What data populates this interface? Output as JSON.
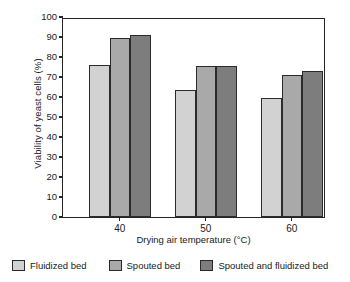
{
  "chart_data": {
    "type": "bar",
    "title": "",
    "xlabel": "Drying air temperature (°C)",
    "ylabel": "Viability of yeast cells (%)",
    "categories": [
      "40",
      "50",
      "60"
    ],
    "series": [
      {
        "name": "Fluidized bed",
        "values": [
          76.0,
          63.5,
          59.5
        ],
        "color": "#d2d2d2"
      },
      {
        "name": "Spouted bed",
        "values": [
          89.5,
          75.5,
          71.0
        ],
        "color": "#a9a9a9"
      },
      {
        "name": "Spouted and fluidized bed",
        "values": [
          91.0,
          75.5,
          73.0
        ],
        "color": "#7d7d7d"
      }
    ],
    "ylim": [
      0,
      100
    ],
    "ytick_step": 10,
    "yticks": [
      "100",
      "90",
      "80",
      "70",
      "60",
      "50",
      "40",
      "30",
      "20",
      "10",
      "0"
    ],
    "grid": false,
    "legend_position": "below",
    "frame": "box",
    "bar_edge_color": "#2b2b2b"
  },
  "axes": {
    "y_title": "Viability of yeast cells (%)",
    "x_title": "Drying air temperature (°C)"
  },
  "legend": {
    "items": [
      {
        "label": "Fluidized bed"
      },
      {
        "label": "Spouted bed"
      },
      {
        "label": "Spouted and fluidized bed"
      }
    ]
  }
}
